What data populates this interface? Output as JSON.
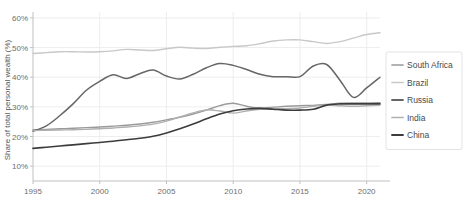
{
  "chart_data": {
    "type": "line",
    "title": "",
    "xlabel": "",
    "ylabel": "Share of total personal wealth (%)",
    "xlim": [
      1995,
      2021
    ],
    "ylim": [
      5,
      62
    ],
    "grid": true,
    "legend_position": "right",
    "x_ticks": [
      "1995",
      "2000",
      "2005",
      "2010",
      "2015",
      "2020"
    ],
    "x_tick_values": [
      1995,
      2000,
      2005,
      2010,
      2015,
      2020
    ],
    "y_ticks": [
      "10%",
      "20%",
      "30%",
      "40%",
      "50%",
      "60%"
    ],
    "y_tick_values": [
      10,
      20,
      30,
      40,
      50,
      60
    ],
    "x": [
      1995,
      1996,
      1997,
      1998,
      1999,
      2000,
      2001,
      2002,
      2003,
      2004,
      2005,
      2006,
      2007,
      2008,
      2009,
      2010,
      2011,
      2012,
      2013,
      2014,
      2015,
      2016,
      2017,
      2018,
      2019,
      2020,
      2021
    ],
    "series": [
      {
        "name": "South Africa",
        "color": "#9a9a9a",
        "width": 1.4,
        "values": [
          22.3,
          22.4,
          22.6,
          22.8,
          23.0,
          23.2,
          23.5,
          23.8,
          24.2,
          24.8,
          25.6,
          26.5,
          27.6,
          28.9,
          30.4,
          31.2,
          30.2,
          29.6,
          29.9,
          30.2,
          30.4,
          30.5,
          30.8,
          31.2,
          31.3,
          31.3,
          31.4
        ]
      },
      {
        "name": "Brazil",
        "color": "#c8c8c8",
        "width": 1.4,
        "values": [
          48.0,
          48.3,
          48.6,
          48.6,
          48.5,
          48.6,
          48.9,
          49.4,
          49.2,
          49.0,
          49.6,
          50.1,
          49.8,
          49.7,
          50.1,
          50.4,
          50.6,
          51.3,
          52.2,
          52.6,
          52.6,
          52.0,
          51.4,
          52.0,
          53.2,
          54.4,
          55.0
        ]
      },
      {
        "name": "Russia",
        "color": "#666666",
        "width": 1.5,
        "values": [
          21.8,
          23.6,
          27.0,
          31.0,
          35.6,
          38.6,
          40.8,
          39.6,
          41.2,
          42.4,
          40.4,
          39.4,
          41.0,
          43.2,
          44.6,
          44.0,
          42.6,
          41.0,
          40.2,
          40.2,
          40.2,
          43.8,
          44.3,
          39.0,
          33.2,
          36.4,
          40.0
        ]
      },
      {
        "name": "India",
        "color": "#b0b0b0",
        "width": 1.4,
        "values": [
          22.0,
          22.1,
          22.2,
          22.3,
          22.4,
          22.6,
          22.9,
          23.2,
          23.6,
          24.2,
          25.2,
          26.6,
          28.0,
          29.0,
          28.6,
          27.9,
          28.6,
          29.2,
          29.4,
          29.4,
          29.6,
          30.2,
          30.6,
          30.4,
          30.2,
          30.4,
          30.6
        ]
      },
      {
        "name": "China",
        "color": "#3c3c3c",
        "width": 1.6,
        "values": [
          16.0,
          16.4,
          16.8,
          17.2,
          17.6,
          18.0,
          18.4,
          18.9,
          19.4,
          20.1,
          21.2,
          22.6,
          24.2,
          26.0,
          27.6,
          28.7,
          29.3,
          29.5,
          29.2,
          28.9,
          28.9,
          29.2,
          30.6,
          31.0,
          31.0,
          31.0,
          31.0
        ]
      }
    ],
    "annotations": []
  },
  "legend": {
    "items": [
      {
        "label": "South Africa"
      },
      {
        "label": "Brazil"
      },
      {
        "label": "Russia"
      },
      {
        "label": "India"
      },
      {
        "label": "China"
      }
    ]
  }
}
